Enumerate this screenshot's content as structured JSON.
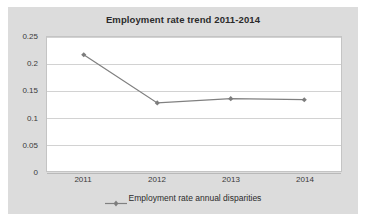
{
  "chart_data": {
    "type": "line",
    "title": "Employment rate trend 2011-2014",
    "xlabel": "",
    "ylabel": "",
    "categories": [
      "2011",
      "2012",
      "2013",
      "2014"
    ],
    "series": [
      {
        "name": "Employment rate annual disparities",
        "values": [
          0.217,
          0.127,
          0.135,
          0.133
        ],
        "color": "#808080",
        "marker": "diamond"
      }
    ],
    "ylim": [
      0,
      0.25
    ],
    "yticks": [
      "0",
      "0.05",
      "0.1",
      "0.15",
      "0.2",
      "0.25"
    ],
    "ytick_values": [
      0,
      0.05,
      0.1,
      0.15,
      0.2,
      0.25
    ],
    "grid": "horizontal",
    "legend_position": "bottom",
    "legend_entries": [
      "Employment rate annual disparities"
    ],
    "plot_background": "#ffffff",
    "figure_background": "#dcdcdc",
    "gridline_color": "#d2d2d2",
    "text_color": "#2b2b2b"
  }
}
